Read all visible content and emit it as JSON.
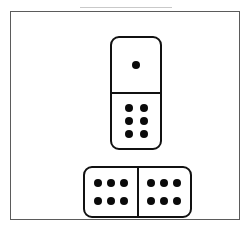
{
  "scene": {
    "title": "Domino tiles illustration",
    "width": 249,
    "height": 232,
    "background_color": "#ffffff",
    "frame": {
      "label": "picture-frame-border",
      "color": "#5b5b5b"
    },
    "scan_artifact": {
      "label": "scan-edge-line",
      "color": "#c9c9c9"
    }
  },
  "palette": {
    "pip_color": "#0a0a0a",
    "tile_outline": "#111111",
    "tile_face": "#ffffff",
    "frame_color": "#5b5b5b"
  },
  "dominoes": [
    {
      "name": "upper-domino",
      "orientation": "vertical",
      "total_pips": 7,
      "halves": [
        {
          "name": "upper-domino-top-half",
          "pip_count": 1,
          "grid_cols": 1,
          "grid_rows": 1,
          "pattern": [
            1
          ]
        },
        {
          "name": "upper-domino-bottom-half",
          "pip_count": 6,
          "grid_cols": 2,
          "grid_rows": 3,
          "pattern": [
            1,
            1,
            1,
            1,
            1,
            1
          ]
        }
      ]
    },
    {
      "name": "lower-domino",
      "orientation": "horizontal",
      "total_pips": 12,
      "halves": [
        {
          "name": "lower-domino-left-half",
          "pip_count": 6,
          "grid_cols": 3,
          "grid_rows": 2,
          "pattern": [
            1,
            1,
            1,
            1,
            1,
            1
          ]
        },
        {
          "name": "lower-domino-right-half",
          "pip_count": 6,
          "grid_cols": 3,
          "grid_rows": 2,
          "pattern": [
            1,
            1,
            1,
            1,
            1,
            1
          ]
        }
      ]
    }
  ]
}
